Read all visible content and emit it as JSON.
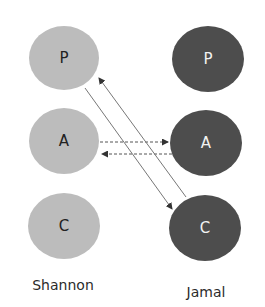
{
  "diagram": {
    "type": "transactional-analysis-ego-states",
    "colors": {
      "left_circles": "#bcbcbc",
      "right_circles": "#4d4d4d",
      "arrows": "#555555"
    },
    "left_person": {
      "name": "Shannon",
      "states": [
        {
          "id": "P",
          "label": "P"
        },
        {
          "id": "A",
          "label": "A"
        },
        {
          "id": "C",
          "label": "C"
        }
      ]
    },
    "right_person": {
      "name": "Jamal",
      "states": [
        {
          "id": "P",
          "label": "P"
        },
        {
          "id": "A",
          "label": "A"
        },
        {
          "id": "C",
          "label": "C"
        }
      ]
    },
    "transactions": [
      {
        "from": "Shannon.A",
        "to": "Jamal.A",
        "style": "dashed"
      },
      {
        "from": "Jamal.A",
        "to": "Shannon.A",
        "style": "dashed"
      },
      {
        "from": "Shannon.P",
        "to": "Jamal.C",
        "style": "solid"
      },
      {
        "from": "Jamal.C",
        "to": "Shannon.P",
        "style": "solid"
      }
    ]
  }
}
